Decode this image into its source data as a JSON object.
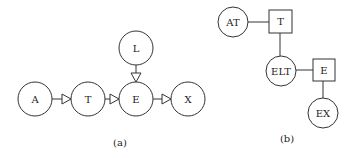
{
  "diagram_a": {
    "caption": "(a)",
    "nodes": {
      "A": {
        "label": "A",
        "shape": "circle"
      },
      "T": {
        "label": "T",
        "shape": "circle"
      },
      "E": {
        "label": "E",
        "shape": "circle"
      },
      "L": {
        "label": "L",
        "shape": "circle"
      },
      "X": {
        "label": "X",
        "shape": "circle"
      }
    },
    "edges": [
      {
        "from": "A",
        "to": "T",
        "type": "directed"
      },
      {
        "from": "T",
        "to": "E",
        "type": "directed"
      },
      {
        "from": "L",
        "to": "E",
        "type": "directed"
      },
      {
        "from": "E",
        "to": "X",
        "type": "directed"
      }
    ]
  },
  "diagram_b": {
    "caption": "(b)",
    "nodes": {
      "AT": {
        "label": "AT",
        "shape": "circle"
      },
      "T": {
        "label": "T",
        "shape": "square"
      },
      "ELT": {
        "label": "ELT",
        "shape": "circle"
      },
      "E": {
        "label": "E",
        "shape": "square"
      },
      "EX": {
        "label": "EX",
        "shape": "circle"
      }
    },
    "edges": [
      {
        "from": "AT",
        "to": "T",
        "type": "undirected"
      },
      {
        "from": "T",
        "to": "ELT",
        "type": "undirected"
      },
      {
        "from": "ELT",
        "to": "E",
        "type": "undirected"
      },
      {
        "from": "E",
        "to": "EX",
        "type": "undirected"
      }
    ]
  },
  "colors": {
    "stroke": "#333333",
    "background": "#ffffff"
  }
}
